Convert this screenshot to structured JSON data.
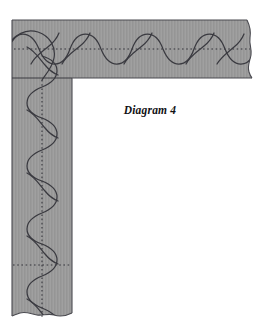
{
  "figure": {
    "caption": "Diagram 4",
    "background_color": "#ffffff"
  },
  "band": {
    "fill_color": "#9a9a9a",
    "edge_line_color": "#4a4a50",
    "stitch_line_color": "#3a3a40",
    "dotted_line_color": "#33333a",
    "horizontal": {
      "label": "horizontal-border-band",
      "x": 12,
      "y": 20,
      "width": 241,
      "height": 58,
      "centerline_y": 49
    },
    "vertical": {
      "label": "vertical-border-band",
      "x": 12,
      "y": 78,
      "width": 60,
      "height": 243,
      "centerline_x": 42
    },
    "corner_divider": {
      "label": "corner-divider-line",
      "y": 78,
      "x_start": 12,
      "x_end": 72
    },
    "cross_dotted_line": {
      "label": "lower-cross-dotted-line",
      "y": 265,
      "x_start": 12,
      "x_end": 72
    }
  },
  "pattern": {
    "type": "serpentine-wave-with-cross-arcs",
    "horizontal_wave": {
      "amplitude": 20,
      "period": 46,
      "start_x": 16,
      "end_x": 252,
      "centerline_y": 49
    },
    "vertical_wave": {
      "amplitude": 20,
      "period": 46,
      "start_y": 62,
      "end_y": 320,
      "centerline_x": 42
    },
    "cross_arc_count_horizontal": 5,
    "cross_arc_count_vertical": 5
  },
  "edges": {
    "right_edge": {
      "label": "torn-scalloped-right-edge",
      "style": "wavy"
    },
    "bottom_edge": {
      "label": "torn-scalloped-bottom-edge",
      "style": "wavy"
    }
  }
}
